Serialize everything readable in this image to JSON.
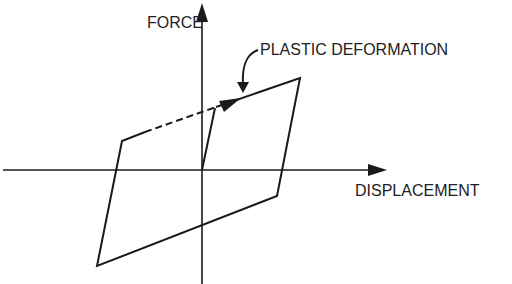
{
  "diagram": {
    "labels": {
      "y_axis": "FORCE",
      "x_axis": "DISPLACEMENT",
      "annotation": "PLASTIC DEFORMATION"
    },
    "colors": {
      "line": "#1a1a1a",
      "text": "#222222",
      "background": "#ffffff"
    }
  }
}
